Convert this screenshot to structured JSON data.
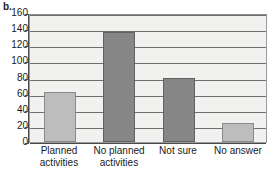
{
  "panel": {
    "label": "b."
  },
  "colors": {
    "bar_light": "#bdbdbd",
    "bar_dark": "#868686",
    "plot_background": "#f1f1ef",
    "gridline": "#6e6e6e",
    "axis": "#4a4a4a",
    "text": "#1a1a1a"
  },
  "axis": {
    "y_ticks": [
      "0",
      "20",
      "40",
      "60",
      "80",
      "100",
      "120",
      "140",
      "160"
    ]
  },
  "bars": [
    {
      "name": "planned-activities",
      "line1": "Planned",
      "line2": "activities",
      "value": 62,
      "shade": "light"
    },
    {
      "name": "no-planned-activities",
      "line1": "No planned",
      "line2": "activities",
      "value": 136,
      "shade": "dark"
    },
    {
      "name": "not-sure",
      "line1": "Not sure",
      "line2": "",
      "value": 79,
      "shade": "dark"
    },
    {
      "name": "no-answer",
      "line1": "No answer",
      "line2": "",
      "value": 24,
      "shade": "light"
    }
  ],
  "chart_data": {
    "type": "bar",
    "title": "",
    "subtitle": "",
    "xlabel": "",
    "ylabel": "",
    "categories": [
      "Planned activities",
      "No planned activities",
      "Not sure",
      "No answer"
    ],
    "values": [
      62,
      136,
      79,
      24
    ],
    "ylim": [
      0,
      160
    ],
    "ytick_step": 20,
    "yticks": [
      0,
      20,
      40,
      60,
      80,
      100,
      120,
      140,
      160
    ],
    "grid": true,
    "grid_axis": "y",
    "legend": false,
    "legend_position": "none",
    "bar_colors": [
      "#bdbdbd",
      "#868686",
      "#868686",
      "#bdbdbd"
    ],
    "panel_label": "b."
  }
}
